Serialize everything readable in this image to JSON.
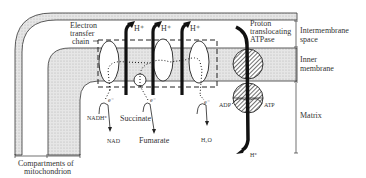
{
  "diagram": {
    "labels": {
      "electron_transfer_chain": [
        "Electron",
        "transfer",
        "chain"
      ],
      "proton_atpase": [
        "Proton",
        "translocating",
        "ATPase"
      ],
      "intermembrane_space": [
        "Intermembrane",
        "space"
      ],
      "inner_membrane": [
        "Inner",
        "membrane"
      ],
      "matrix": "Matrix",
      "compartments": [
        "Compartments of",
        "mitochondrion"
      ],
      "h_plus": "H⁺",
      "e_minus": "e⁻",
      "nadh": "NADH⁺",
      "nad": "NAD",
      "succinate": "Succinate",
      "fumarate": "Fumarate",
      "h2o": "H₂O",
      "adp": "ADP",
      "atp": "ATP"
    },
    "colors": {
      "outline": "#333333",
      "membrane_fill": "#d9d9d9",
      "background": "#ffffff",
      "arrow": "#1a1a1a"
    }
  }
}
